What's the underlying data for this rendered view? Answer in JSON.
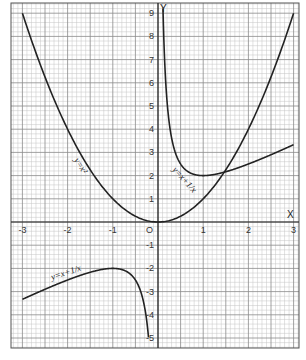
{
  "chart_data": {
    "type": "line",
    "title": "",
    "xlabel": "X",
    "ylabel": "Y",
    "origin_label": "O",
    "xlim": [
      -3,
      3
    ],
    "ylim": [
      -5,
      9
    ],
    "grid": true,
    "x_ticks": [
      "-3",
      "-2",
      "-1",
      "1",
      "2",
      "3"
    ],
    "y_ticks": [
      "9",
      "8",
      "7",
      "6",
      "5",
      "4",
      "3",
      "2",
      "1",
      "-1",
      "-2",
      "-3",
      "-4",
      "-5"
    ],
    "series": [
      {
        "name": "y=x^2",
        "label": "y=x²",
        "x": [
          -3,
          -2.5,
          -2,
          -1.5,
          -1,
          -0.5,
          0,
          0.5,
          1,
          1.5,
          2,
          2.5,
          3
        ],
        "y": [
          9,
          6.25,
          4,
          2.25,
          1,
          0.25,
          0,
          0.25,
          1,
          2.25,
          4,
          6.25,
          9
        ]
      },
      {
        "name": "y=x+1/x (x>0)",
        "label": "y=x+1/x",
        "x": [
          0.11,
          0.2,
          0.3,
          0.5,
          0.75,
          1,
          1.5,
          2,
          2.5,
          3
        ],
        "y": [
          9.2,
          5.2,
          3.63,
          2.5,
          2.08,
          2,
          2.17,
          2.5,
          2.9,
          3.33
        ]
      },
      {
        "name": "y=x+1/x (x<0)",
        "label": "y=x+1/x",
        "x": [
          -3,
          -2.5,
          -2,
          -1.5,
          -1,
          -0.75,
          -0.5,
          -0.3,
          -0.21
        ],
        "y": [
          -3.33,
          -2.9,
          -2.5,
          -2.17,
          -2,
          -2.08,
          -2.5,
          -3.63,
          -4.97
        ]
      }
    ],
    "annotations": [
      {
        "text": "y=x²",
        "near": [
          -1.4,
          2.8
        ]
      },
      {
        "text": "y=x+1/x",
        "near": [
          0.5,
          2.3
        ]
      },
      {
        "text": "y=x+1/x",
        "near": [
          -1.6,
          -2.4
        ]
      }
    ],
    "intersection": {
      "x": 1.47,
      "y": 2.15
    }
  },
  "labels": {
    "x_axis": "X",
    "y_axis": "Y",
    "origin": "O",
    "parabola": "y=x²",
    "hyperbola_right": "y=x+1/x",
    "hyperbola_left": "y=x+1/x"
  }
}
